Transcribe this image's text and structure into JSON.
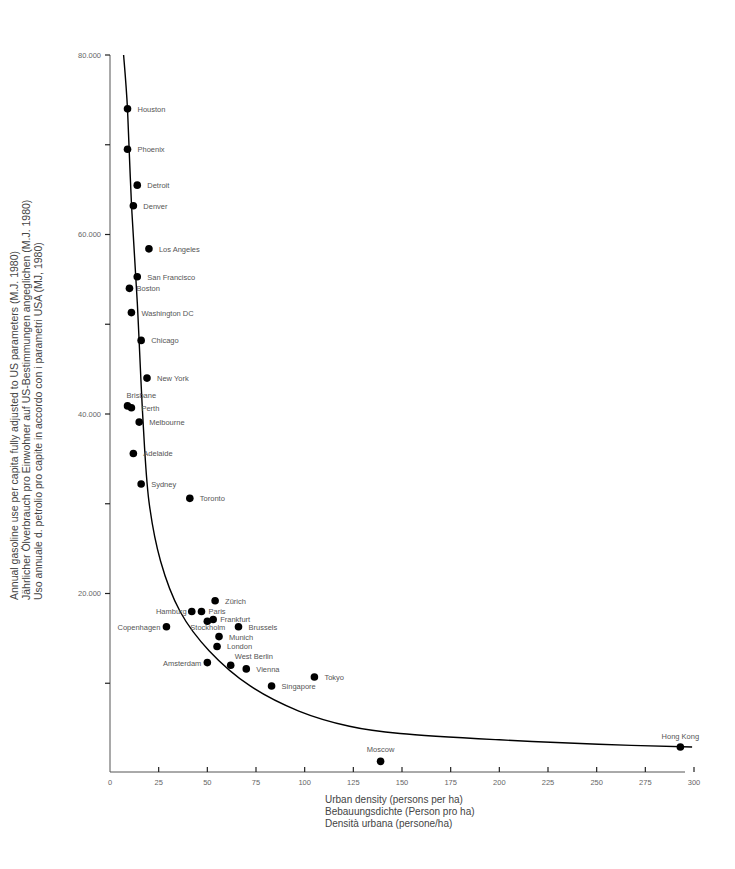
{
  "chart_data": {
    "type": "scatter",
    "title": "",
    "xlabel": [
      "Urban density (persons per ha)",
      "Bebauungsdichte (Person pro ha)",
      "Densità urbana (persone/ha)"
    ],
    "ylabel": [
      "Annual gasoline use per capita fully adjusted to US parameters (M.J. 1980)",
      "Jährlicher Ölverbrauch pro Einwohner auf US-Bestimmungen angeglichen (M.J. 1980)",
      "Uso annuale d. petrolio pro capite in accordo con i parametri USA (MJ, 1980)"
    ],
    "xlim": [
      0,
      300
    ],
    "ylim": [
      0,
      80000
    ],
    "x_ticks": [
      0,
      25,
      50,
      75,
      100,
      125,
      150,
      175,
      200,
      225,
      250,
      275,
      300
    ],
    "x_tick_labels": [
      "0",
      "25",
      "50",
      "75",
      "100",
      "125",
      "150",
      "175",
      "200",
      "225",
      "250",
      "275",
      "300"
    ],
    "y_ticks": [
      20000,
      40000,
      60000,
      80000
    ],
    "y_tick_labels": [
      "20.000",
      "40.000",
      "60.000",
      "80.000"
    ],
    "y_minor_ticks": [
      10000,
      30000,
      50000,
      70000
    ],
    "grid": false,
    "legend": null,
    "points": [
      {
        "city": "Houston",
        "x": 9,
        "y": 74000
      },
      {
        "city": "Phoenix",
        "x": 9,
        "y": 69500
      },
      {
        "city": "Detroit",
        "x": 14,
        "y": 65500
      },
      {
        "city": "Denver",
        "x": 12,
        "y": 63200
      },
      {
        "city": "Los Angeles",
        "x": 20,
        "y": 58400
      },
      {
        "city": "San Francisco",
        "x": 14,
        "y": 55300
      },
      {
        "city": "Boston",
        "x": 10,
        "y": 54000
      },
      {
        "city": "Washington DC",
        "x": 11,
        "y": 51300
      },
      {
        "city": "Chicago",
        "x": 16,
        "y": 48200
      },
      {
        "city": "New York",
        "x": 19,
        "y": 44000
      },
      {
        "city": "Brisbane",
        "x": 9,
        "y": 40900
      },
      {
        "city": "Perth",
        "x": 11,
        "y": 40700
      },
      {
        "city": "Melbourne",
        "x": 15,
        "y": 39100
      },
      {
        "city": "Adelaide",
        "x": 12,
        "y": 35600
      },
      {
        "city": "Sydney",
        "x": 16,
        "y": 32200
      },
      {
        "city": "Toronto",
        "x": 41,
        "y": 30600
      },
      {
        "city": "Zürich",
        "x": 54,
        "y": 19200
      },
      {
        "city": "Hamburg",
        "x": 42,
        "y": 18000
      },
      {
        "city": "Paris",
        "x": 47,
        "y": 18000
      },
      {
        "city": "Frankfurt",
        "x": 53,
        "y": 17100
      },
      {
        "city": "Stockholm",
        "x": 50,
        "y": 16900
      },
      {
        "city": "Brussels",
        "x": 66,
        "y": 16300
      },
      {
        "city": "Copenhagen",
        "x": 29,
        "y": 16300
      },
      {
        "city": "Munich",
        "x": 56,
        "y": 15200
      },
      {
        "city": "London",
        "x": 55,
        "y": 14100
      },
      {
        "city": "Amsterdam",
        "x": 50,
        "y": 12300
      },
      {
        "city": "West Berlin",
        "x": 62,
        "y": 12000
      },
      {
        "city": "Vienna",
        "x": 70,
        "y": 11600
      },
      {
        "city": "Tokyo",
        "x": 105,
        "y": 10700
      },
      {
        "city": "Singapore",
        "x": 83,
        "y": 9700
      },
      {
        "city": "Moscow",
        "x": 139,
        "y": 1300
      },
      {
        "city": "Hong Kong",
        "x": 293,
        "y": 2900
      }
    ],
    "trend_curve": {
      "type": "hyperbolic fit",
      "points": [
        [
          7,
          80000
        ],
        [
          9,
          74000
        ],
        [
          11,
          63600
        ],
        [
          14,
          52400
        ],
        [
          17,
          39100
        ],
        [
          20,
          30300
        ],
        [
          26,
          23600
        ],
        [
          36,
          18000
        ],
        [
          51,
          13600
        ],
        [
          72,
          9700
        ],
        [
          97,
          6900
        ],
        [
          123,
          5200
        ],
        [
          149,
          4400
        ],
        [
          200,
          3700
        ],
        [
          251,
          3200
        ],
        [
          299,
          2900
        ]
      ]
    }
  },
  "labels": {
    "x_title_1": "Urban density (persons per ha)",
    "x_title_2": "Bebauungsdichte (Person pro ha)",
    "x_title_3": "Densità urbana (persone/ha)",
    "y_title_1": "Annual gasoline use per capita fully adjusted to US parameters (M.J. 1980)",
    "y_title_2": "Jährlicher Ölverbrauch pro Einwohner auf US-Bestimmungen angeglichen (M.J. 1980)",
    "y_title_3": "Uso annuale d. petrolio pro capite in accordo con i parametri USA (MJ, 1980)"
  },
  "colors": {
    "point": "#000000",
    "curve": "#000000",
    "axis": "#555555",
    "text": "#555555"
  }
}
